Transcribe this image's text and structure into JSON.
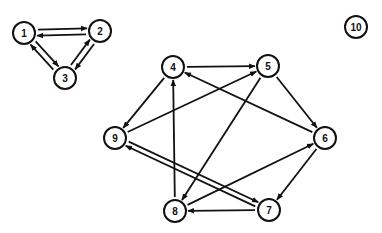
{
  "diagram": {
    "type": "directed-graph",
    "node_radius": 11,
    "colors": {
      "stroke": "#111111",
      "background": "#ffffff"
    },
    "nodes": [
      {
        "id": "1",
        "label": "1",
        "x": 24,
        "y": 33
      },
      {
        "id": "2",
        "label": "2",
        "x": 100,
        "y": 31
      },
      {
        "id": "3",
        "label": "3",
        "x": 65,
        "y": 78
      },
      {
        "id": "4",
        "label": "4",
        "x": 173,
        "y": 67
      },
      {
        "id": "5",
        "label": "5",
        "x": 268,
        "y": 66
      },
      {
        "id": "6",
        "label": "6",
        "x": 325,
        "y": 138
      },
      {
        "id": "7",
        "label": "7",
        "x": 269,
        "y": 210
      },
      {
        "id": "8",
        "label": "8",
        "x": 175,
        "y": 211
      },
      {
        "id": "9",
        "label": "9",
        "x": 115,
        "y": 138
      },
      {
        "id": "10",
        "label": "10",
        "x": 356,
        "y": 27
      }
    ],
    "edges": [
      {
        "from": "2",
        "to": "1",
        "offset": -3
      },
      {
        "from": "1",
        "to": "2",
        "offset": -3
      },
      {
        "from": "1",
        "to": "3",
        "offset": -3
      },
      {
        "from": "3",
        "to": "1",
        "offset": -3
      },
      {
        "from": "2",
        "to": "3",
        "offset": -3
      },
      {
        "from": "3",
        "to": "2",
        "offset": -3
      },
      {
        "from": "4",
        "to": "5",
        "offset": 0
      },
      {
        "from": "6",
        "to": "4",
        "offset": 0
      },
      {
        "from": "5",
        "to": "6",
        "offset": 0
      },
      {
        "from": "4",
        "to": "9",
        "offset": 0
      },
      {
        "from": "9",
        "to": "5",
        "offset": 0
      },
      {
        "from": "8",
        "to": "4",
        "offset": 0
      },
      {
        "from": "5",
        "to": "8",
        "offset": 0
      },
      {
        "from": "8",
        "to": "6",
        "offset": 0
      },
      {
        "from": "6",
        "to": "7",
        "offset": 0
      },
      {
        "from": "7",
        "to": "8",
        "offset": 0
      },
      {
        "from": "9",
        "to": "7",
        "offset": -2.5
      },
      {
        "from": "7",
        "to": "9",
        "offset": -2.5
      }
    ]
  }
}
